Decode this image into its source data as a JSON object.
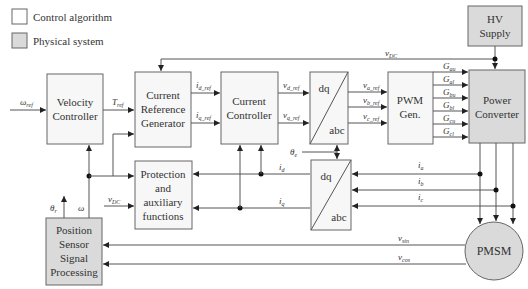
{
  "legend": {
    "items": [
      {
        "label": "Control algorithm",
        "kind": "control"
      },
      {
        "label": "Physical system",
        "kind": "physical"
      }
    ]
  },
  "blocks": {
    "velocity_controller": {
      "line1": "Velocity",
      "line2": "Controller"
    },
    "current_ref_gen": {
      "line1": "Current",
      "line2": "Reference",
      "line3": "Generator"
    },
    "current_controller": {
      "line1": "Current",
      "line2": "Controller"
    },
    "dq_abc_top": {
      "top": "dq",
      "bottom": "abc"
    },
    "pwm_gen": {
      "line1": "PWM",
      "line2": "Gen."
    },
    "power_converter": {
      "line1": "Power",
      "line2": "Converter"
    },
    "hv_supply": {
      "line1": "HV",
      "line2": "Supply"
    },
    "protection": {
      "line1": "Protection",
      "line2": "and",
      "line3": "auxiliary",
      "line4": "functions"
    },
    "dq_abc_bottom": {
      "top": "dq",
      "bottom": "abc"
    },
    "position_sensor": {
      "line1": "Position",
      "line2": "Sensor",
      "line3": "Signal",
      "line4": "Processing"
    },
    "pmsm": {
      "label": "PMSM"
    }
  },
  "signals": {
    "omega_ref": {
      "base": "ω",
      "sub": "ref"
    },
    "t_ref": {
      "base": "T",
      "sub": "ref"
    },
    "id_ref": {
      "base": "i",
      "sub": "d_ref"
    },
    "iq_ref": {
      "base": "i",
      "sub": "q_ref"
    },
    "vd_ref": {
      "base": "v",
      "sub": "d_ref"
    },
    "vq_ref": {
      "base": "v",
      "sub": "q_ref"
    },
    "va_ref": {
      "base": "v",
      "sub": "a_ref"
    },
    "vb_ref": {
      "base": "v",
      "sub": "b_ref"
    },
    "vc_ref": {
      "base": "v",
      "sub": "c_ref"
    },
    "g_au": {
      "base": "G",
      "sub": "au"
    },
    "g_al": {
      "base": "G",
      "sub": "al"
    },
    "g_bu": {
      "base": "G",
      "sub": "bu"
    },
    "g_bl": {
      "base": "G",
      "sub": "bl"
    },
    "g_cu": {
      "base": "G",
      "sub": "cu"
    },
    "g_cl": {
      "base": "G",
      "sub": "cl"
    },
    "v_dc_top": {
      "base": "v",
      "sub": "DC"
    },
    "v_dc_left": {
      "base": "v",
      "sub": "DC"
    },
    "theta_e": {
      "base": "θ",
      "sub": "e"
    },
    "theta_r": {
      "base": "θ",
      "sub": "r"
    },
    "omega": {
      "base": "ω",
      "sub": ""
    },
    "i_d": {
      "base": "i",
      "sub": "d"
    },
    "i_q": {
      "base": "i",
      "sub": "q"
    },
    "i_a": {
      "base": "i",
      "sub": "a"
    },
    "i_b": {
      "base": "i",
      "sub": "b"
    },
    "i_c": {
      "base": "i",
      "sub": "c"
    },
    "v_sin": {
      "base": "v",
      "sub": "sin"
    },
    "v_cos": {
      "base": "v",
      "sub": "cos"
    }
  }
}
